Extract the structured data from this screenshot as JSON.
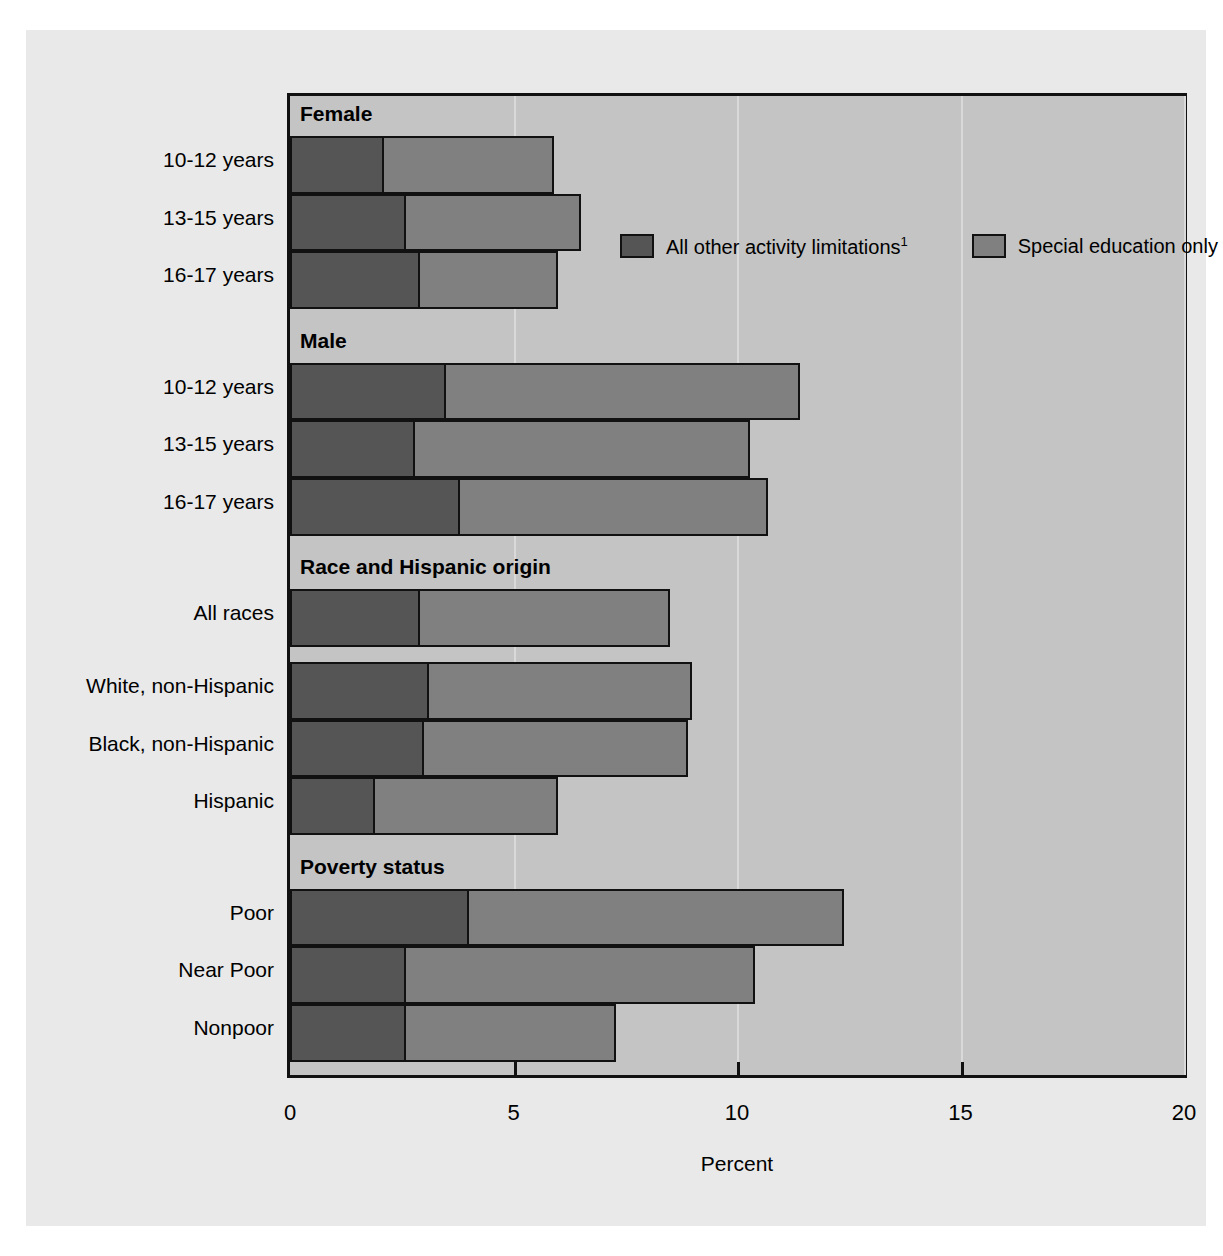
{
  "chart_data": {
    "type": "bar",
    "orientation": "horizontal",
    "stacked": true,
    "title": "",
    "xlabel": "Percent",
    "ylabel": "",
    "xlim": [
      0,
      20
    ],
    "xticks": [
      0,
      5,
      10,
      15,
      20
    ],
    "xtick_labels": [
      "0",
      "5",
      "10",
      "15",
      "20"
    ],
    "grid": true,
    "legend_position": "inside-top-right",
    "series": [
      {
        "name": "All other activity limitations",
        "footnote": "1",
        "color": "#555555",
        "values": [
          2.1,
          2.6,
          2.9,
          3.5,
          2.8,
          3.8,
          2.9,
          3.1,
          3.0,
          1.9,
          4.0,
          2.6,
          2.6
        ]
      },
      {
        "name": "Special education only",
        "color": "#808080",
        "values": [
          3.8,
          3.9,
          3.1,
          7.9,
          7.5,
          6.9,
          5.6,
          5.9,
          5.9,
          4.1,
          8.4,
          7.8,
          4.7
        ]
      }
    ],
    "totals": [
      5.9,
      6.5,
      6.0,
      11.4,
      10.3,
      10.7,
      8.5,
      9.0,
      8.9,
      6.0,
      12.4,
      10.4,
      7.3
    ],
    "groups": [
      {
        "header": "Female",
        "categories": [
          "10-12 years",
          "13-15 years",
          "16-17 years"
        ]
      },
      {
        "header": "Male",
        "categories": [
          "10-12 years",
          "13-15 years",
          "16-17 years"
        ]
      },
      {
        "header": "Race and Hispanic origin",
        "categories": [
          "All races",
          "White, non-Hispanic",
          "Black, non-Hispanic",
          "Hispanic"
        ]
      },
      {
        "header": "Poverty status",
        "categories": [
          "Poor",
          "Near Poor",
          "Nonpoor"
        ]
      }
    ],
    "categories": [
      "10-12 years",
      "13-15 years",
      "16-17 years",
      "10-12 years",
      "13-15 years",
      "16-17 years",
      "All races",
      "White, non-Hispanic",
      "Black, non-Hispanic",
      "Hispanic",
      "Poor",
      "Near Poor",
      "Nonpoor"
    ]
  },
  "legend": {
    "items": [
      {
        "label": "All other activity limitations",
        "footnote": "1",
        "swatch": "dark"
      },
      {
        "label": "Special education only",
        "footnote": "",
        "swatch": "light"
      }
    ]
  },
  "axis": {
    "x_title": "Percent",
    "ticks": [
      "0",
      "5",
      "10",
      "15",
      "20"
    ]
  },
  "group_headers": [
    "Female",
    "Male",
    "Race and Hispanic origin",
    "Poverty status"
  ],
  "row_labels": [
    "10-12 years",
    "13-15 years",
    "16-17 years",
    "10-12 years",
    "13-15 years",
    "16-17 years",
    "All races",
    "White, non-Hispanic",
    "Black, non-Hispanic",
    "Hispanic",
    "Poor",
    "Near Poor",
    "Nonpoor"
  ],
  "colors": {
    "dark_segment": "#555555",
    "light_segment": "#808080",
    "plot_background": "#c4c4c4",
    "page_background": "#e9e9e9",
    "axis": "#111111",
    "gridline": "#d9d9d9"
  }
}
